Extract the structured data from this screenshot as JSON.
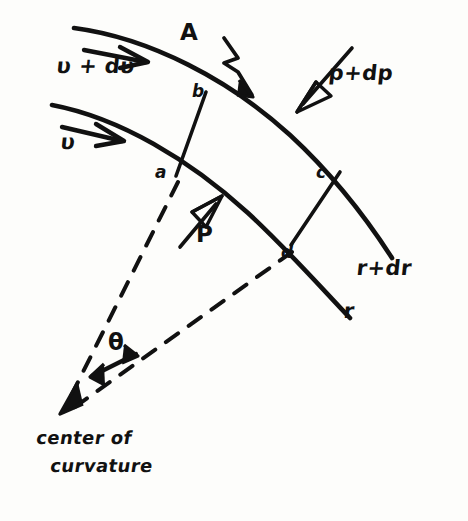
{
  "figure": {
    "kind": "hand-drawn-physics-diagram",
    "ink_color": "#111111",
    "paper_color": "#fdfdfb"
  },
  "labels": {
    "velocity_outer": "υ + dυ",
    "velocity_inner": "υ",
    "area": "A",
    "pressure_outer": "p+dp",
    "pressure_inner": "P",
    "radius_outer": "r+dr",
    "radius_inner": "r",
    "angle": "θ",
    "center_line1": "center of",
    "center_line2": "curvature",
    "point_a": "a",
    "point_b": "b",
    "point_c": "c",
    "point_d": "d"
  },
  "icons": {
    "velocity_arrow_outer": "arrow-right-icon",
    "velocity_arrow_inner": "arrow-right-icon",
    "area_pointer": "zigzag-arrow-icon",
    "pressure_arrow_outer": "hollow-arrow-down-icon",
    "pressure_arrow_inner": "hollow-arrow-up-icon",
    "angle_arrows": "double-headed-arc-arrow-icon",
    "center_arrow": "arrow-down-left-icon"
  },
  "geometry": {
    "outer_arc": "curved streamline from upper-left to lower-right (radius r+dr)",
    "inner_arc": "curved streamline below the outer one (radius r)",
    "radial_segment_ba": "short straight segment joining b on outer arc to a on inner arc",
    "radial_segment_cd": "short straight segment joining c on outer arc to d on inner arc",
    "dashed_radius_a": "dashed line from a to center of curvature",
    "dashed_radius_d": "dashed line from d to center of curvature",
    "center_point": [
      60,
      415
    ]
  }
}
